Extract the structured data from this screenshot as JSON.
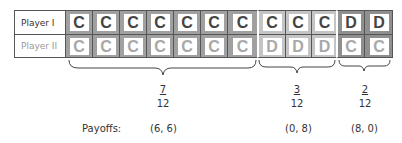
{
  "rows": [
    {
      "label": "Player I",
      "cells": [
        "C",
        "C",
        "C",
        "C",
        "C",
        "C",
        "C",
        "C",
        "C",
        "C",
        "D",
        "D"
      ]
    },
    {
      "label": "Player II",
      "cells": [
        "C",
        "C",
        "C",
        "C",
        "C",
        "C",
        "C",
        "D",
        "D",
        "D",
        "C",
        "C"
      ]
    }
  ],
  "groups": [
    {
      "count": 7,
      "fraction": {
        "num": "7",
        "den": "12"
      },
      "payoff": "(6, 6)",
      "frame_color": "#a0a0a0"
    },
    {
      "count": 3,
      "fraction": {
        "num": "3",
        "den": "12"
      },
      "payoff": "(0, 8)",
      "frame_color": "#c4c4c4"
    },
    {
      "count": 2,
      "fraction": {
        "num": "2",
        "den": "12"
      },
      "payoff": "(8, 0)",
      "frame_color": "#8f8f8f"
    }
  ],
  "payoffs_label": "Payoffs:"
}
